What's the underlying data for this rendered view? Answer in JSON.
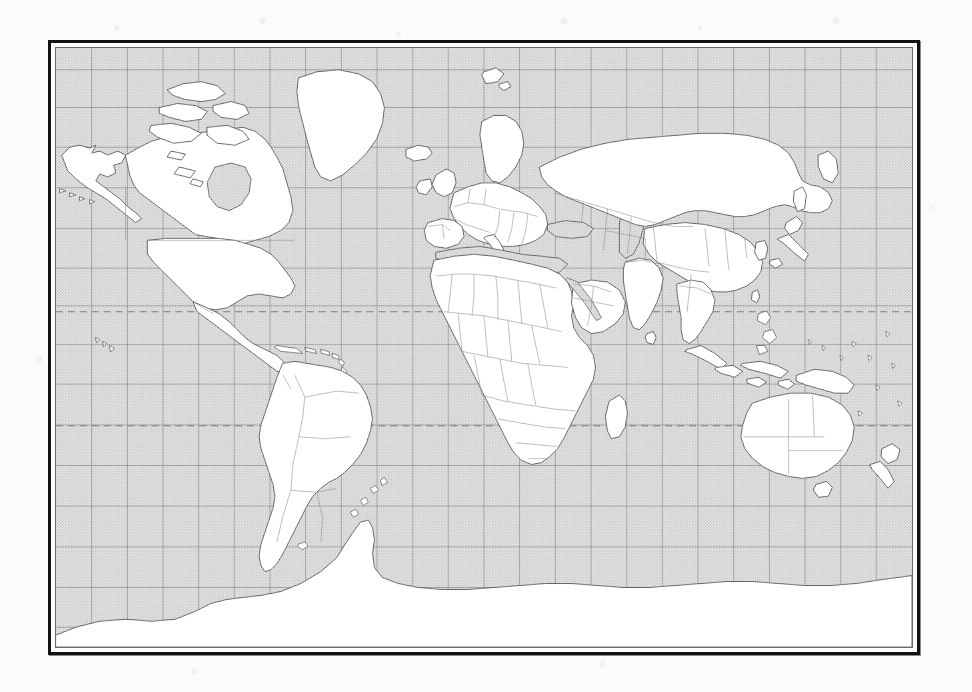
{
  "document": {
    "type": "scanned-world-map",
    "title": "World Map",
    "projection": "Mercator",
    "paper_color": "#fbfbf9",
    "frame_color": "#14120f",
    "ocean_color": "#d9d9d9",
    "land_color": "#ffffff",
    "coastline_color": "#3a3a38",
    "border_color": "#7a7a78",
    "graticule_color": "#6e6e6b",
    "tropic_line_color": "#5a5a58"
  },
  "frame": {
    "left": 48,
    "top": 40,
    "width": 872,
    "height": 615,
    "outer_stroke": 3,
    "inner_stroke": 1
  },
  "graticule": {
    "longitude_step_degrees": 15,
    "latitude_step_degrees": 10,
    "meridian_count": 23,
    "parallel_count": 13,
    "grid_visible": true
  },
  "special_lines": [
    {
      "name": "tropic-of-cancer",
      "style": "dashed",
      "y": 309
    },
    {
      "name": "tropic-of-capricorn",
      "style": "dashed",
      "y": 424
    }
  ],
  "features": {
    "continents": [
      "North America",
      "South America",
      "Europe",
      "Africa",
      "Asia",
      "Australia",
      "Antarctica"
    ],
    "notable_islands": [
      "Greenland",
      "Iceland",
      "Great Britain",
      "Ireland",
      "Japan",
      "Philippines",
      "Indonesia",
      "New Guinea",
      "New Zealand",
      "Madagascar",
      "Sri Lanka",
      "Tasmania",
      "Cuba",
      "Hawaii",
      "Svalbard",
      "Novaya Zemlya",
      "Sakhalin",
      "Taiwan",
      "Baffin Island",
      "Victoria Island",
      "Ellesmere Island"
    ],
    "seas_shaded": [
      "Mediterranean Sea",
      "Black Sea",
      "Caspian Sea",
      "Red Sea",
      "Persian Gulf",
      "Hudson Bay",
      "Baltic Sea",
      "Great Lakes"
    ],
    "internal_borders": true,
    "labels_present": false
  }
}
